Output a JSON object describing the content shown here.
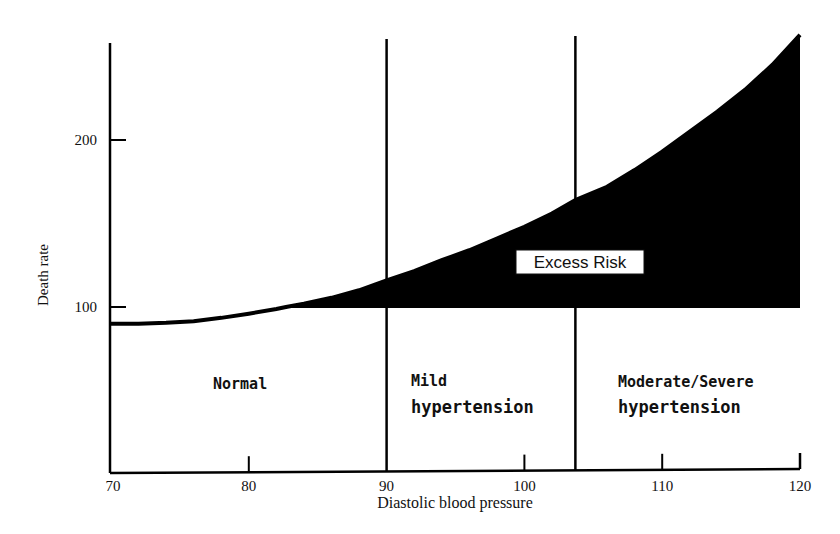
{
  "chart_data": {
    "type": "area",
    "title": "",
    "xlabel": "Diastolic blood pressure",
    "ylabel": "Death rate",
    "xlim": [
      70,
      120
    ],
    "ylim": [
      0,
      260
    ],
    "x_ticks": [
      70,
      80,
      90,
      100,
      110,
      120
    ],
    "y_ticks": [
      100,
      200
    ],
    "grid": false,
    "baseline": 100,
    "series": [
      {
        "name": "Death rate",
        "x": [
          70,
          72,
          74,
          76,
          78,
          80,
          82,
          82.7,
          84,
          86,
          88,
          90,
          92,
          94,
          96,
          98,
          100,
          102,
          103.7,
          106,
          108,
          110,
          112,
          114,
          116,
          118,
          120
        ],
        "y": [
          90,
          90,
          90.5,
          91.5,
          93.5,
          96,
          98.8,
          100,
          102,
          105.5,
          110,
          116,
          121.5,
          128,
          134,
          141,
          148,
          156,
          164,
          172,
          182,
          193,
          205,
          217,
          230,
          245,
          263
        ]
      }
    ],
    "regions": [
      {
        "name": "Normal",
        "label": "Normal",
        "from": 70,
        "to": 90
      },
      {
        "name": "Mild hypertension",
        "label_lines": [
          "Mild",
          "hypertension"
        ],
        "from": 90,
        "to": 103.7
      },
      {
        "name": "Moderate/Severe hypertension",
        "label_lines": [
          "Moderate/Severe",
          "hypertension"
        ],
        "from": 103.7,
        "to": 120
      }
    ],
    "region_dividers": [
      90,
      103.7
    ],
    "annotations": [
      {
        "text": "Excess Risk",
        "description": "shaded area between death-rate curve and baseline 100, from about 82.7 to 120"
      }
    ],
    "fill_color": "#000000",
    "line_color": "#000000"
  }
}
